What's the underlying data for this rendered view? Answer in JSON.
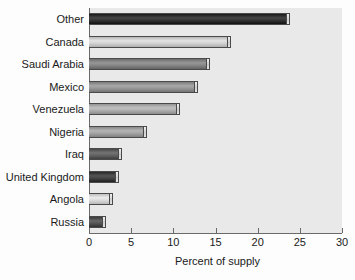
{
  "chart_data": {
    "type": "bar",
    "orientation": "horizontal",
    "title": "",
    "xlabel": "Percent of supply",
    "ylabel": "",
    "xlim": [
      0,
      30
    ],
    "xticks": [
      0,
      5,
      10,
      15,
      20,
      25,
      30
    ],
    "xticklabels": [
      "0",
      "5",
      "10",
      "15",
      "20",
      "25",
      "30"
    ],
    "grid": false,
    "legend": false,
    "categories": [
      "Other",
      "Canada",
      "Saudi Arabia",
      "Mexico",
      "Venezuela",
      "Nigeria",
      "Iraq",
      "United Kingdom",
      "Angola",
      "Russia"
    ],
    "values": [
      23.8,
      16.8,
      14.4,
      12.9,
      10.8,
      6.9,
      3.9,
      3.6,
      2.9,
      2.0
    ],
    "bars": [
      {
        "label": "Other",
        "value": 23.8,
        "color": "#2b2b2b"
      },
      {
        "label": "Canada",
        "value": 16.8,
        "color": "#c9c9c9"
      },
      {
        "label": "Saudi Arabia",
        "value": 14.4,
        "color": "#7d7d7d"
      },
      {
        "label": "Mexico",
        "value": 12.9,
        "color": "#8e8e8e"
      },
      {
        "label": "Venezuela",
        "value": 10.8,
        "color": "#a6a6a6"
      },
      {
        "label": "Nigeria",
        "value": 6.9,
        "color": "#9b9b9b"
      },
      {
        "label": "Iraq",
        "value": 3.9,
        "color": "#5a5a5a"
      },
      {
        "label": "United Kingdom",
        "value": 3.6,
        "color": "#3a3a3a"
      },
      {
        "label": "Angola",
        "value": 2.9,
        "color": "#d2d2d2"
      },
      {
        "label": "Russia",
        "value": 2.0,
        "color": "#4d4d4d"
      }
    ]
  },
  "style": {
    "page_background": "#fdfdfd",
    "plot_background": "#e9e9e9",
    "axis_color": "#6a6a6a",
    "text_color": "#1a1a1a",
    "bar_edge_color": "#4a4a4a"
  }
}
